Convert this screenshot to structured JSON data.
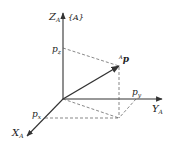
{
  "diagram": {
    "frame_label": "{A}",
    "axes": {
      "z": {
        "label": "Z",
        "subscript": "A"
      },
      "y": {
        "label": "Y",
        "subscript": "A"
      },
      "x": {
        "label": "X",
        "subscript": "A"
      }
    },
    "components": {
      "pz": {
        "label": "p",
        "subscript": "z"
      },
      "py": {
        "label": "p",
        "subscript": "y"
      },
      "px": {
        "label": "p",
        "subscript": "x"
      }
    },
    "vector": {
      "superscript": "A",
      "label": "p"
    },
    "colors": {
      "line": "#333333",
      "dashed": "#555555"
    }
  }
}
